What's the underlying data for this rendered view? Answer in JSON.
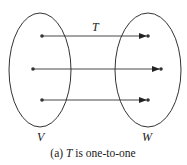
{
  "diagram": {
    "function_label": "T",
    "domain_label": "V",
    "codomain_label": "W",
    "caption_prefix": "(a) ",
    "caption_var": "T",
    "caption_suffix": " is one-to-one",
    "mappings": [
      {
        "from": "v1",
        "to": "w1"
      },
      {
        "from": "v2",
        "to": "w2"
      },
      {
        "from": "v3",
        "to": "w3"
      }
    ],
    "stroke_color": "#333333"
  }
}
